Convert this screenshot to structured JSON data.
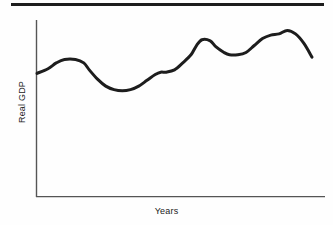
{
  "figure": {
    "title_rule": "top-horizontal-rule",
    "background_color": "#fefefe",
    "line_color": "#1d1d1d",
    "axis_color": "#555555"
  },
  "chart_data": {
    "type": "line",
    "title": "",
    "subtitle": "",
    "xlabel": "Years",
    "ylabel": "Real GDP",
    "grid": false,
    "legend": null,
    "legend_position": "none",
    "axis_ticks": {
      "x": [],
      "y": []
    },
    "xlim": [
      0,
      100
    ],
    "ylim": [
      0,
      100
    ],
    "annotations": [],
    "series": [
      {
        "name": "Real GDP",
        "color": "#1d1d1d",
        "line_width": 3,
        "description": "Business cycle: recurring expansions and recessions around a rising long-run trend, ending in a downturn.",
        "x": [
          0,
          4,
          7,
          10,
          14,
          17,
          19,
          22,
          25,
          28,
          31,
          34,
          37,
          40,
          43,
          45,
          47,
          50,
          53,
          56,
          58,
          60,
          63,
          65,
          68,
          70,
          73,
          76,
          79,
          82,
          85,
          88,
          91,
          94,
          97,
          100
        ],
        "y": [
          54,
          58,
          63,
          66,
          66,
          63,
          57,
          49,
          43,
          40,
          39,
          40,
          43,
          48,
          53,
          55,
          55,
          57,
          63,
          70,
          78,
          83,
          82,
          77,
          72,
          70,
          70,
          72,
          78,
          84,
          87,
          88,
          91,
          88,
          80,
          68
        ]
      }
    ],
    "features": [
      {
        "label": "initial-level",
        "x": 0,
        "y": 54
      },
      {
        "label": "first-peak",
        "x": 12,
        "y": 66
      },
      {
        "label": "first-trough",
        "x": 31,
        "y": 39
      },
      {
        "label": "recovery-shoulder",
        "x": 46,
        "y": 55
      },
      {
        "label": "second-peak",
        "x": 60,
        "y": 83
      },
      {
        "label": "mid-shoulder",
        "x": 67,
        "y": 71
      },
      {
        "label": "second-trough",
        "x": 72,
        "y": 70
      },
      {
        "label": "late-shoulder",
        "x": 83,
        "y": 85
      },
      {
        "label": "global-peak",
        "x": 90,
        "y": 91
      },
      {
        "label": "final-downturn",
        "x": 100,
        "y": 68
      }
    ]
  },
  "labels": {
    "y_axis": "Real GDP",
    "x_axis": "Years"
  }
}
